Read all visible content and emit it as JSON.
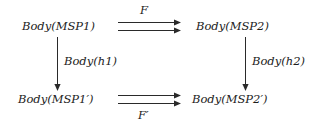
{
  "diagram": {
    "type": "commutative-square",
    "background_color": "#ffffff",
    "ink_color": "#1c1c1c",
    "nodes": {
      "top_left": "Body(MSP1)",
      "top_right": "Body(MSP2)",
      "bottom_left": "Body(MSP1′)",
      "bottom_right": "Body(MSP2′)"
    },
    "arrows": {
      "top": {
        "label": "F",
        "style": "double-horizontal",
        "direction": "left-to-right",
        "label_position": "above",
        "from": "Body(MSP1)",
        "to": "Body(MSP2)"
      },
      "bottom": {
        "label": "F′",
        "style": "double-horizontal",
        "direction": "left-to-right",
        "label_position": "below",
        "from": "Body(MSP1′)",
        "to": "Body(MSP2′)"
      },
      "left": {
        "label": "Body(h1)",
        "style": "single-vertical",
        "direction": "top-to-bottom",
        "label_position": "right",
        "from": "Body(MSP1)",
        "to": "Body(MSP1′)"
      },
      "right": {
        "label": "Body(h2)",
        "style": "single-vertical",
        "direction": "top-to-bottom",
        "label_position": "right",
        "from": "Body(MSP2)",
        "to": "Body(MSP2′)"
      }
    }
  }
}
